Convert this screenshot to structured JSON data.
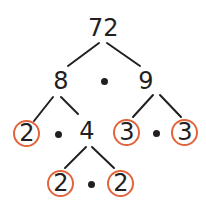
{
  "diagram": {
    "type": "factor-tree",
    "root": "72",
    "level1": {
      "left": "8",
      "right": "9"
    },
    "level2": {
      "left_a": "2",
      "left_b": "4",
      "right_a": "3",
      "right_b": "3"
    },
    "level3": {
      "left": "2",
      "right": "2"
    },
    "prime_circle_color": "#e2643c",
    "text_color": "#231f20"
  }
}
